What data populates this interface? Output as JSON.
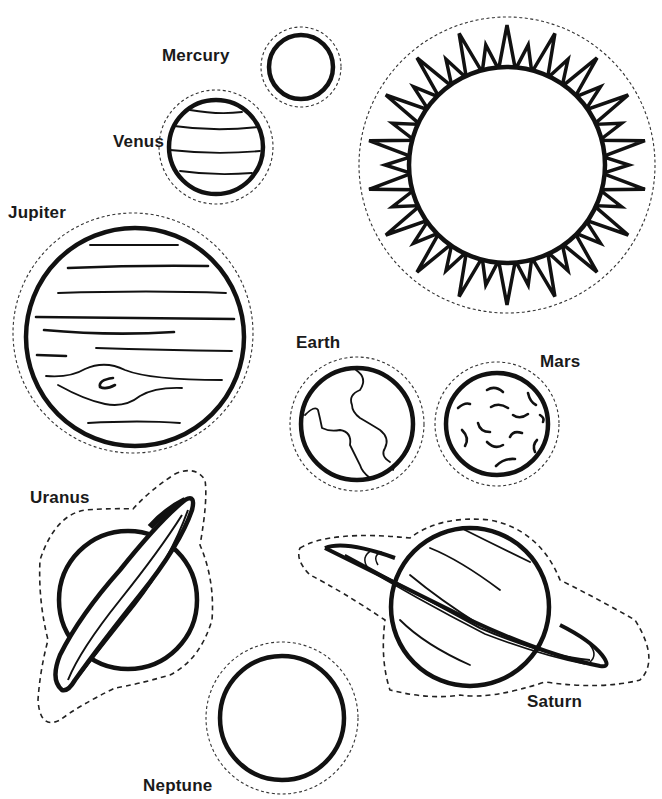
{
  "colors": {
    "line": "#111111",
    "background": "#ffffff",
    "cut_line": "#333333"
  },
  "bodies": {
    "sun": {
      "label": "",
      "icon": "sun-icon"
    },
    "mercury": {
      "label": "Mercury",
      "icon": "planet-mercury-icon"
    },
    "venus": {
      "label": "Venus",
      "icon": "planet-venus-icon"
    },
    "jupiter": {
      "label": "Jupiter",
      "icon": "planet-jupiter-icon"
    },
    "earth": {
      "label": "Earth",
      "icon": "planet-earth-icon"
    },
    "mars": {
      "label": "Mars",
      "icon": "planet-mars-icon"
    },
    "uranus": {
      "label": "Uranus",
      "icon": "planet-uranus-icon"
    },
    "saturn": {
      "label": "Saturn",
      "icon": "planet-saturn-icon"
    },
    "neptune": {
      "label": "Neptune",
      "icon": "planet-neptune-icon"
    }
  }
}
